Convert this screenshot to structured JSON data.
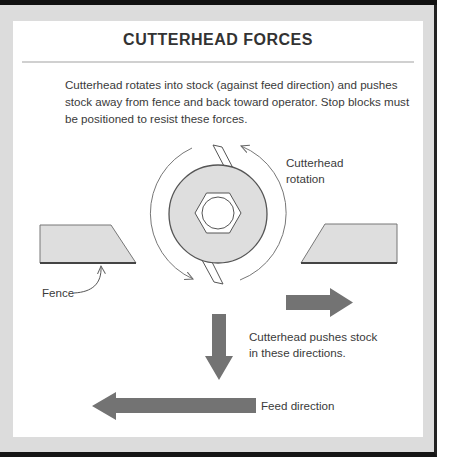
{
  "title": "CUTTERHEAD FORCES",
  "intro": "Cutterhead rotates into stock (against feed direction) and pushes stock away from fence and back toward operator. Stop blocks must be positioned to resist these forces.",
  "labels": {
    "rotation_line1": "Cutterhead",
    "rotation_line2": "rotation",
    "fence": "Fence",
    "push_line1": "Cutterhead pushes stock",
    "push_line2": "in these directions.",
    "feed": "Feed direction"
  },
  "colors": {
    "frame": "#dcdcdc",
    "stock_fill": "#dedede",
    "arrow_fill": "#737373",
    "outline": "#555555"
  },
  "icons": {
    "cutterhead": "disc-with-hex-nut",
    "rotation_arrows": "curved-arrows",
    "push_arrows": "block-arrows-right-down",
    "feed_arrow": "block-arrow-left"
  }
}
